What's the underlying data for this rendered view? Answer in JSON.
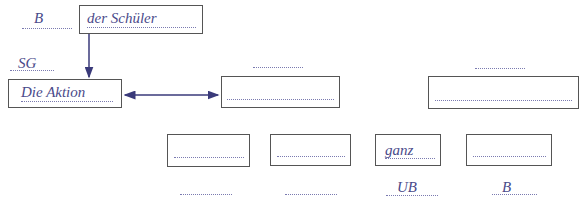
{
  "diagram": {
    "top_box": {
      "text": "der Schüler",
      "label": "B"
    },
    "main_box": {
      "text": "Die Aktion",
      "label": "SG"
    },
    "middle_box": {
      "text": "",
      "label": ""
    },
    "right_box": {
      "text": "",
      "label": ""
    },
    "bottom_boxes": [
      {
        "text": "",
        "label": ""
      },
      {
        "text": "",
        "label": ""
      },
      {
        "text": "ganz",
        "label": "UB"
      },
      {
        "text": "",
        "label": "B"
      }
    ]
  },
  "colors": {
    "text": "#4a4a8a",
    "border": "#555555",
    "arrow": "#3a3a7a"
  }
}
